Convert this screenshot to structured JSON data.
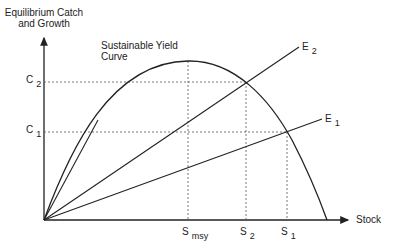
{
  "diagram": {
    "y_axis_title": [
      "Equilibrium Catch",
      "and Growth"
    ],
    "x_axis_label": "Stock",
    "curve_label": [
      "Sustainable Yield",
      "Curve"
    ],
    "y_ticks": [
      {
        "main": "C",
        "sub": "2"
      },
      {
        "main": "C",
        "sub": "1"
      }
    ],
    "x_ticks": [
      {
        "main": "S",
        "sub": "msy"
      },
      {
        "main": "S",
        "sub": "2"
      },
      {
        "main": "S",
        "sub": "1"
      }
    ],
    "effort_lines": [
      {
        "main": "E",
        "sub": "2"
      },
      {
        "main": "E",
        "sub": "1"
      }
    ],
    "colors": {
      "line": "#222222",
      "background": "#ffffff"
    }
  }
}
